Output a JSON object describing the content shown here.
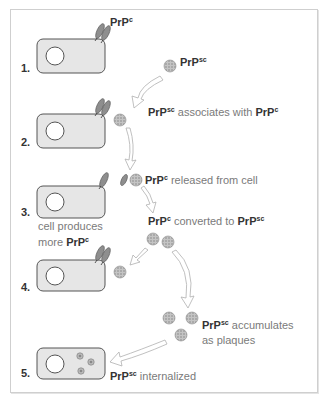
{
  "diagram": {
    "colors": {
      "cell_fill": "#e6e6e6",
      "cell_stroke": "#555555",
      "protein_fill": "#8e8e8e",
      "blob_fill": "#b8b8b8",
      "arrow_fill": "#ffffff",
      "arrow_stroke": "#b0b0b0",
      "text_gray": "#7a7a7a",
      "text_bold": "#333333"
    },
    "steps": [
      {
        "number": "1.",
        "label_main": "PrP",
        "label_sup": "c"
      },
      {
        "number": "2."
      },
      {
        "number": "3.",
        "note_line1": "cell produces",
        "note_line2_prefix": "more ",
        "note_line2_bold": "PrP",
        "note_line2_sup": "c"
      },
      {
        "number": "4."
      },
      {
        "number": "5."
      }
    ],
    "labels": {
      "prpsc_free": {
        "bold": "PrP",
        "sup": "sc"
      },
      "associates": {
        "bold1": "PrP",
        "sup1": "sc",
        "text": " associates with ",
        "bold2": "PrP",
        "sup2": "c"
      },
      "released": {
        "bold": "PrP",
        "sup": "c",
        "text": " released from cell"
      },
      "converted": {
        "bold1": "PrP",
        "sup1": "c",
        "text": " converted to ",
        "bold2": "PrP",
        "sup2": "sc"
      },
      "accumulates": {
        "bold": "PrP",
        "sup": "sc",
        "text1": " accumulates",
        "text2": "as plaques"
      },
      "internalized": {
        "bold": "PrP",
        "sup": "sc",
        "text": " internalized"
      }
    }
  }
}
